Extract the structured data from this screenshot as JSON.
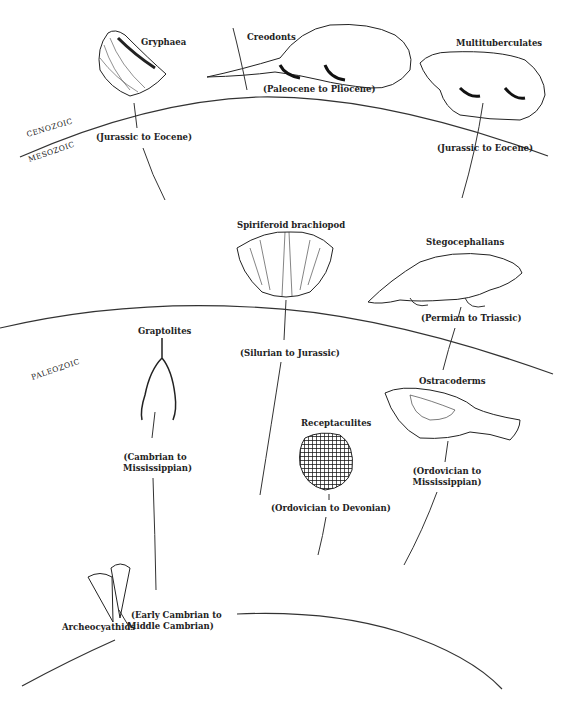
{
  "eras": {
    "cenozoic": "CENOZOIC",
    "mesozoic": "MESOZOIC",
    "paleozoic": "PALEOZOIC"
  },
  "fossils": [
    {
      "name": "Gryphaea",
      "range": "(Jurassic to Eocene)",
      "era": "Mesozoic–Cenozoic"
    },
    {
      "name": "Creodonts",
      "range": "(Paleocene to Pliocene)",
      "era": "Cenozoic"
    },
    {
      "name": "Multituberculates",
      "range": "(Jurassic to Eocene)",
      "era": "Mesozoic–Cenozoic"
    },
    {
      "name": "Spiriferoid brachiopod",
      "range": "(Silurian to Jurassic)",
      "era": "Paleozoic–Mesozoic"
    },
    {
      "name": "Stegocephalians",
      "range": "(Permian to Triassic)",
      "era": "Paleozoic–Mesozoic"
    },
    {
      "name": "Graptolites",
      "range_line1": "(Cambrian to",
      "range_line2": "Mississippian)",
      "era": "Paleozoic"
    },
    {
      "name": "Ostracoderms",
      "range_line1": "(Ordovician to",
      "range_line2": "Mississippian)",
      "era": "Paleozoic"
    },
    {
      "name": "Receptaculites",
      "range": "(Ordovician to Devonian)",
      "era": "Paleozoic"
    },
    {
      "name": "Archeocyathids",
      "range_line1": "(Early Cambrian to",
      "range_line2": "Middle Cambrian)",
      "era": "Paleozoic"
    }
  ],
  "colors": {
    "line": "#333333",
    "ink": "#1a1a1a",
    "background": "#ffffff"
  }
}
